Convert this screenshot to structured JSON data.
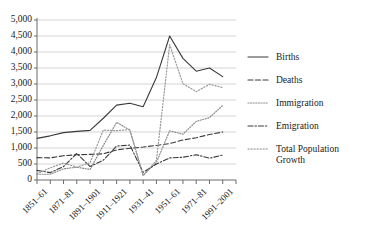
{
  "chart_data": {
    "type": "line",
    "title": "",
    "subtitle": "",
    "xlabel": "",
    "ylabel": "",
    "grid": true,
    "legend_position": "right",
    "ylim": [
      0,
      5000
    ],
    "ytick_step": 500,
    "ytick_labels": [
      "0",
      "500",
      "1,000",
      "1,500",
      "2,000",
      "2,500",
      "3,000",
      "3,500",
      "4,000",
      "4,500",
      "5,000"
    ],
    "ytick_values": [
      0,
      500,
      1000,
      1500,
      2000,
      2500,
      3000,
      3500,
      4000,
      4500,
      5000
    ],
    "categories": [
      "1851–61",
      "1861–71",
      "1871–81",
      "1881–91",
      "1891–1901",
      "1901–1911",
      "1911–1921",
      "1921–1931",
      "1931–41",
      "1941–51",
      "1951–61",
      "1961–71",
      "1971–81",
      "1981–91",
      "1991–2001"
    ],
    "xtick_labels_shown": [
      "1851–61",
      "1871–81",
      "1891–1901",
      "1911–1921",
      "1931–41",
      "1951–61",
      "1971–81",
      "1991–2001"
    ],
    "series": [
      {
        "name": "Births",
        "style": "solid",
        "color": "#3a3a3a",
        "values": [
          1300,
          1380,
          1480,
          1520,
          1550,
          1930,
          2340,
          2400,
          2290,
          3200,
          4500,
          3800,
          3400,
          3500,
          3230
        ]
      },
      {
        "name": "Deaths",
        "style": "dashed",
        "color": "#3a3a3a",
        "values": [
          700,
          690,
          760,
          790,
          800,
          820,
          940,
          990,
          1030,
          1080,
          1140,
          1250,
          1320,
          1420,
          1500
        ]
      },
      {
        "name": "Immigration",
        "style": "dotted",
        "color": "#8a8a8a",
        "values": [
          180,
          180,
          350,
          400,
          330,
          1080,
          1800,
          1560,
          150,
          550,
          1540,
          1430,
          1830,
          1950,
          2330
        ]
      },
      {
        "name": "Emigration",
        "style": "dash-dot",
        "color": "#3a3a3a",
        "values": [
          300,
          230,
          420,
          830,
          420,
          620,
          1060,
          1090,
          240,
          500,
          690,
          710,
          790,
          680,
          780
        ]
      },
      {
        "name": "Total Population Growth",
        "style": "dotted-light",
        "color": "#9a9a9a",
        "values": [
          200,
          380,
          530,
          400,
          540,
          1560,
          1540,
          1580,
          130,
          610,
          4230,
          3010,
          2760,
          2990,
          2890
        ]
      }
    ]
  },
  "legend": {
    "items": [
      {
        "label": "Births",
        "key": "solid"
      },
      {
        "label": "Deaths",
        "key": "dashed"
      },
      {
        "label": "Immigration",
        "key": "dotted"
      },
      {
        "label": "Emigration",
        "key": "dash-dot"
      },
      {
        "label": "Total Population",
        "key": "dotted-light"
      },
      {
        "label": "Growth",
        "key": "dotted-light-cont"
      }
    ]
  }
}
